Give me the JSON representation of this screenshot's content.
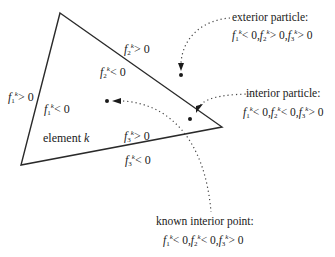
{
  "diagram": {
    "element_label": "element",
    "element_index": "k",
    "superscript": "k",
    "edge_labels": [
      {
        "id": "f2_out",
        "func": "f",
        "index": "2",
        "relation": "> 0"
      },
      {
        "id": "f2_in",
        "func": "f",
        "index": "2",
        "relation": "< 0"
      },
      {
        "id": "f1_out",
        "func": "f",
        "index": "1",
        "relation": "> 0"
      },
      {
        "id": "f1_in",
        "func": "f",
        "index": "1",
        "relation": "< 0"
      },
      {
        "id": "f3_in",
        "func": "f",
        "index": "3",
        "relation": "> 0"
      },
      {
        "id": "f3_out",
        "func": "f",
        "index": "3",
        "relation": "< 0"
      }
    ],
    "annotations": {
      "exterior": {
        "title": "exterior particle:",
        "conds": [
          {
            "index": "1",
            "relation": "< 0,"
          },
          {
            "index": "2",
            "relation": "> 0,"
          },
          {
            "index": "3",
            "relation": "> 0"
          }
        ]
      },
      "interior": {
        "title": "interior particle:",
        "conds": [
          {
            "index": "1",
            "relation": "< 0,"
          },
          {
            "index": "2",
            "relation": "< 0,"
          },
          {
            "index": "3",
            "relation": "> 0"
          }
        ]
      },
      "known": {
        "title": "known interior point:",
        "conds": [
          {
            "index": "1",
            "relation": "< 0,"
          },
          {
            "index": "2",
            "relation": "< 0,"
          },
          {
            "index": "3",
            "relation": "> 0"
          }
        ]
      }
    },
    "colors": {
      "line": "#2a2a2a",
      "background": "#ffffff"
    }
  }
}
